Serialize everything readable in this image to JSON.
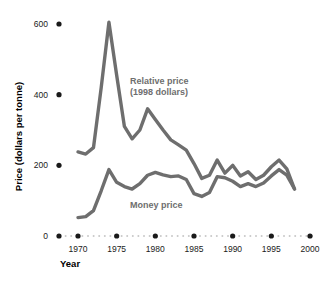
{
  "chart_data": {
    "type": "line",
    "title": "",
    "xlabel": "Year",
    "ylabel": "Price (dollars per tonne)",
    "xlim": [
      1969,
      2000
    ],
    "ylim": [
      0,
      640
    ],
    "xticks": [
      1970,
      1975,
      1980,
      1985,
      1990,
      1995,
      2000
    ],
    "xtick_labels": [
      "1970",
      "1975",
      "1980",
      "1985",
      "1990",
      "1995",
      "2000"
    ],
    "yticks": [
      0,
      200,
      400,
      600
    ],
    "ytick_labels": [
      "0",
      "200",
      "400",
      "600"
    ],
    "grid": false,
    "legend_position": "inline-annotation",
    "line_color": "#6e6e6e",
    "tick_marker_color": "#1a1a1a",
    "axis_dot_color": "#c8c8c8",
    "series": [
      {
        "name": "Relative price (1998 dollars)",
        "label_lines": [
          "Relative price",
          "(1998 dollars)"
        ],
        "x": [
          1970,
          1971,
          1972,
          1973,
          1974,
          1975,
          1976,
          1977,
          1978,
          1979,
          1980,
          1981,
          1982,
          1983,
          1984,
          1985,
          1986,
          1987,
          1988,
          1989,
          1990,
          1991,
          1992,
          1993,
          1994,
          1995,
          1996,
          1997,
          1998
        ],
        "values": [
          238,
          232,
          250,
          420,
          605,
          455,
          310,
          275,
          300,
          360,
          330,
          300,
          272,
          258,
          243,
          205,
          163,
          172,
          215,
          178,
          200,
          170,
          182,
          160,
          172,
          196,
          215,
          190,
          133
        ]
      },
      {
        "name": "Money price",
        "label_lines": [
          "Money price"
        ],
        "x": [
          1970,
          1971,
          1972,
          1973,
          1974,
          1975,
          1976,
          1977,
          1978,
          1979,
          1980,
          1981,
          1982,
          1983,
          1984,
          1985,
          1986,
          1987,
          1988,
          1989,
          1990,
          1991,
          1992,
          1993,
          1994,
          1995,
          1996,
          1997,
          1998
        ],
        "values": [
          52,
          55,
          72,
          128,
          188,
          152,
          140,
          133,
          148,
          172,
          180,
          173,
          168,
          170,
          160,
          120,
          112,
          123,
          168,
          165,
          155,
          140,
          148,
          140,
          150,
          170,
          188,
          172,
          133
        ]
      }
    ]
  },
  "axes": {
    "y_title": "Price (dollars per tonne)",
    "x_title": "Year"
  }
}
